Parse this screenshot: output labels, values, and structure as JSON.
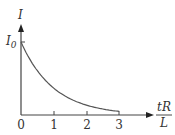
{
  "chart_data": {
    "type": "line",
    "title": "",
    "xlabel_num": "tR",
    "xlabel_den": "L",
    "ylabel": "I",
    "y_marker": "I",
    "y_marker_sub": "0",
    "x_ticks": [
      "0",
      "1",
      "2",
      "3"
    ],
    "x": [
      0,
      0.25,
      0.5,
      0.75,
      1,
      1.5,
      2,
      2.5,
      3
    ],
    "y": [
      1,
      0.779,
      0.607,
      0.472,
      0.368,
      0.223,
      0.135,
      0.082,
      0.05
    ],
    "function": "I = I0 * exp(-tR/L)",
    "xlim": [
      0,
      3.3
    ],
    "ylim": [
      0,
      1.2
    ],
    "grid": false,
    "line_color": "#555555"
  }
}
